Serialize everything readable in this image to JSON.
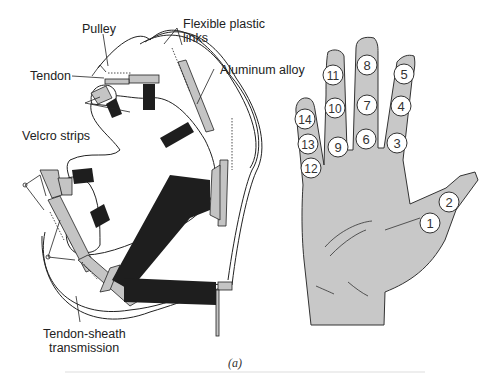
{
  "figure": {
    "caption": "(a)",
    "left_panel": {
      "title": "Tendon-driven hand exoskeleton",
      "labels": {
        "pulley": "Pulley",
        "flexible_links": [
          "Flexible plastic",
          "links"
        ],
        "tendon": "Tendon",
        "aluminum": "Aluminum alloy",
        "velcro": "Velcro strips",
        "tendon_sheath": [
          "Tendon-sheath",
          "transmission"
        ]
      }
    },
    "right_panel": {
      "title": "Hand joint numbering",
      "joints": [
        {
          "id": "1",
          "x": 430,
          "y": 223
        },
        {
          "id": "2",
          "x": 449,
          "y": 202
        },
        {
          "id": "3",
          "x": 397,
          "y": 143
        },
        {
          "id": "4",
          "x": 401,
          "y": 106
        },
        {
          "id": "5",
          "x": 404,
          "y": 74
        },
        {
          "id": "6",
          "x": 366,
          "y": 139
        },
        {
          "id": "7",
          "x": 367,
          "y": 105
        },
        {
          "id": "8",
          "x": 367,
          "y": 65
        },
        {
          "id": "9",
          "x": 338,
          "y": 147
        },
        {
          "id": "10",
          "x": 335,
          "y": 108
        },
        {
          "id": "11",
          "x": 333,
          "y": 75
        },
        {
          "id": "12",
          "x": 311,
          "y": 168
        },
        {
          "id": "13",
          "x": 308,
          "y": 144
        },
        {
          "id": "14",
          "x": 305,
          "y": 119
        }
      ],
      "colors": {
        "hand_fill": "#c8c8c8",
        "outline": "#333333",
        "circle_fill": "#ffffff"
      }
    },
    "colors": {
      "strap": "#1e1e1e",
      "link": "#c4c4c4",
      "line": "#222222"
    }
  }
}
